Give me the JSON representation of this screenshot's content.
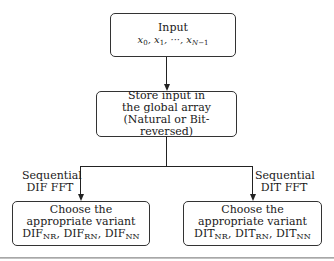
{
  "diagram": {
    "nodes": {
      "input": {
        "title": "Input",
        "sequence": [
          "x0",
          "x1",
          "···",
          "xN−1"
        ]
      },
      "store": {
        "lines": [
          "Store input in",
          "the global array",
          "(Natural or Bit-reversed)"
        ]
      },
      "dif": {
        "lines": [
          "Choose the",
          "appropriate variant"
        ],
        "variants": [
          {
            "base": "DIF",
            "sub": "NR"
          },
          {
            "base": "DIF",
            "sub": "RN"
          },
          {
            "base": "DIF",
            "sub": "NN"
          }
        ]
      },
      "dit": {
        "lines": [
          "Choose the",
          "appropriate variant"
        ],
        "variants": [
          {
            "base": "DIT",
            "sub": "NR"
          },
          {
            "base": "DIT",
            "sub": "RN"
          },
          {
            "base": "DIT",
            "sub": "NN"
          }
        ]
      }
    },
    "edges": {
      "left": {
        "label_line1": "Sequential",
        "label_line2": "DIF FFT"
      },
      "right": {
        "label_line1": "Sequential",
        "label_line2": "DIT FFT"
      }
    }
  }
}
